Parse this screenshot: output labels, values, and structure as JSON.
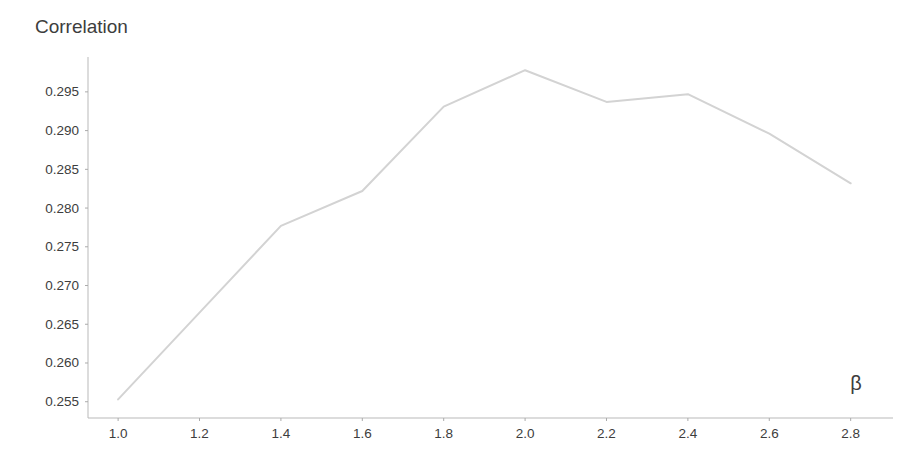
{
  "chart_data": {
    "type": "line",
    "title": "Correlation",
    "xlabel": "β",
    "ylabel": "Correlation",
    "x": [
      1.0,
      1.2,
      1.4,
      1.6,
      1.8,
      2.0,
      2.2,
      2.4,
      2.6,
      2.8
    ],
    "series": [
      {
        "name": "correlation-vs-beta",
        "values": [
          0.2553,
          0.2665,
          0.2777,
          0.2822,
          0.2931,
          0.2978,
          0.2937,
          0.2947,
          0.2896,
          0.2832
        ]
      }
    ],
    "x_tick_labels": [
      "1.0",
      "1.2",
      "1.4",
      "1.6",
      "1.8",
      "2.0",
      "2.2",
      "2.4",
      "2.6",
      "2.8"
    ],
    "y_tick_labels": [
      "0.255",
      "0.260",
      "0.265",
      "0.270",
      "0.275",
      "0.280",
      "0.285",
      "0.290",
      "0.295"
    ],
    "xlim": [
      0.926,
      2.904
    ],
    "ylim": [
      0.2529,
      0.2995
    ],
    "grid": false,
    "legend": null,
    "line_color": "#d3d3d3",
    "axis_color": "#b9b9b9",
    "tick_color": "#ababab",
    "label_color": "#3d3d3d"
  }
}
